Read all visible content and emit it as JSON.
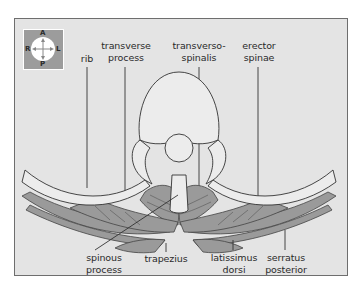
{
  "figure": {
    "orientation_compass": {
      "top": "A",
      "bottom": "P",
      "left": "R",
      "right": "L"
    },
    "labels_top": [
      {
        "id": "rib",
        "lines": [
          "rib"
        ]
      },
      {
        "id": "transverse-process",
        "lines": [
          "transverse",
          "process"
        ]
      },
      {
        "id": "transversospinalis",
        "lines": [
          "transverso-",
          "spinalis"
        ]
      },
      {
        "id": "erector-spinae",
        "lines": [
          "erector",
          "spinae"
        ]
      }
    ],
    "labels_bottom": [
      {
        "id": "spinous-process",
        "lines": [
          "spinous",
          "process"
        ]
      },
      {
        "id": "trapezius",
        "lines": [
          "trapezius"
        ]
      },
      {
        "id": "latissimus-dorsi",
        "lines": [
          "latissimus",
          "dorsi"
        ]
      },
      {
        "id": "serratus-posterior",
        "lines": [
          "serratus",
          "posterior"
        ]
      }
    ],
    "colors": {
      "background": "#e4e4e4",
      "frame_border": "#6e6e6e",
      "muscle": "#9a9a9a",
      "bone": "#e8e8e8",
      "outline": "#333333",
      "compass_bg": "#9c9c9c"
    }
  }
}
